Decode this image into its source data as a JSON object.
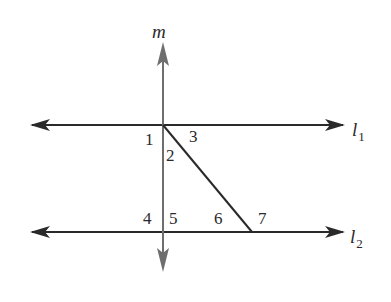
{
  "diagram": {
    "type": "parallel-lines-with-transversals",
    "lines": {
      "m": {
        "label": "m",
        "orientation": "vertical",
        "color": "#6e6e6e"
      },
      "l1": {
        "label": "l",
        "subscript": "1",
        "orientation": "horizontal",
        "color": "#2a2a2a"
      },
      "l2": {
        "label": "l",
        "subscript": "2",
        "orientation": "horizontal",
        "color": "#2a2a2a"
      },
      "transversal": {
        "from": "intersection of m and l1",
        "to": "point on l2",
        "color": "#2a2a2a"
      }
    },
    "angles": [
      {
        "id": "1",
        "label": "1"
      },
      {
        "id": "2",
        "label": "2"
      },
      {
        "id": "3",
        "label": "3"
      },
      {
        "id": "4",
        "label": "4"
      },
      {
        "id": "5",
        "label": "5"
      },
      {
        "id": "6",
        "label": "6"
      },
      {
        "id": "7",
        "label": "7"
      }
    ]
  }
}
